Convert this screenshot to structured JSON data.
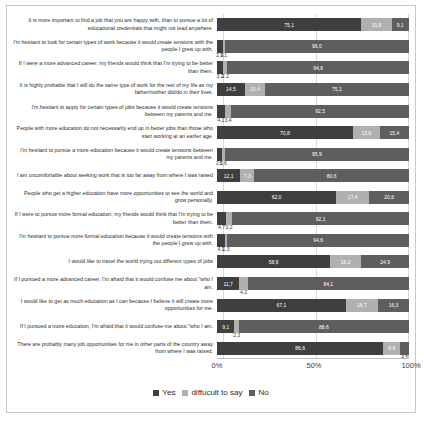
{
  "chart_data": {
    "type": "bar",
    "orientation": "horizontal",
    "stacked": true,
    "stacked_percent": true,
    "title": "",
    "xlabel": "",
    "ylabel": "",
    "xlim": [
      0,
      100
    ],
    "xticks": [
      "0%",
      "50%",
      "100%"
    ],
    "xtick_values": [
      0,
      50,
      100
    ],
    "grid": true,
    "legend_position": "bottom",
    "legend": [
      "Yes",
      "diffucult to say",
      "No"
    ],
    "series": [
      {
        "name": "Yes",
        "color": "#3f3f3f"
      },
      {
        "name": "diffucult to say",
        "color": "#b0b0b0"
      },
      {
        "name": "No",
        "color": "#5e5e5e"
      }
    ],
    "categories": [
      "It is more important to find a job that you are happy with, than to pursue a lot of educational credentials that might not lead anywhere.",
      "I'm hesitant to look for certain types of work because it would create tensions with the people I grew up with.",
      "If I were a more advanced career, my friends would think that I'm trying to be better than them.",
      "It is highly probable that I will do the same type of work for the rest of my life as my father/mother did/do in their lives.",
      "I'm hesitant to apply for certain types of jobs because it would create tensions between my parents and me.",
      "People with more education do not necessarily end up in better jobs than those who start working at an earlier age.",
      "I'm hesitant to pursue a more education because it would create tensions between my parents and me.",
      "I am uncomfortable about seeking work that is too far away from where I was raised",
      "People who get a higher education have more opportunities to see the world and grow personally.",
      "If I were to pursue more formal education, my friends would think that I'm trying to be better than them.",
      "I'm hesitant to pursue more formal education because it would create tensions with the people I grew up with.",
      "I would like to travel the world trying out different types of jobs",
      "If I pursued a more advanced career, I'm afraid that it would confuse me about \"who I am.",
      "I would like to get as much education as I can because I believe it will create more opportunities for me.",
      "If I pursued a more education, I'm afraid that it would confuse me about \"who I am.",
      "There are probably many job opportunities for me in other parts of the country away from where I was raised."
    ],
    "rows": [
      {
        "label": "It is more important to find a job that you are happy with, than to pursue a lot of educational credentials that might not lead anywhere.",
        "yes": 75.1,
        "difficult": 15.8,
        "no": 9.1,
        "yes_text": "75,1",
        "difficult_text": "15,8",
        "no_text": "9,1"
      },
      {
        "label": "I'm hesitant to look for certain types of work because it would create tensions with the people I grew up with.",
        "yes": 2.9,
        "difficult": 1.1,
        "no": 96.0,
        "yes_text": "2,9",
        "difficult_text": "1,1",
        "no_text": "96,0"
      },
      {
        "label": "If I were a more advanced career, my friends would think that I'm trying to be better than them.",
        "yes": 3.2,
        "difficult": 2.2,
        "no": 94.6,
        "yes_text": "3,2",
        "difficult_text": "2,2",
        "no_text": "94,6"
      },
      {
        "label": "It is highly probable that I will do the same type of work for the rest of my life as my father/mother did/do in their lives.",
        "yes": 14.5,
        "difficult": 10.4,
        "no": 75.1,
        "yes_text": "14,5",
        "difficult_text": "10,4",
        "no_text": "75,1"
      },
      {
        "label": "I'm hesitant to apply for certain types of jobs because it would create tensions between my parents and me.",
        "yes": 4.1,
        "difficult": 3.4,
        "no": 92.5,
        "yes_text": "4,1",
        "difficult_text": "3,4",
        "no_text": "92,5"
      },
      {
        "label": "People with more education do not necessarily end up in better jobs than those who start working at an earlier age.",
        "yes": 70.8,
        "difficult": 13.9,
        "no": 15.4,
        "yes_text": "70,8",
        "difficult_text": "13,9",
        "no_text": "15,4"
      },
      {
        "label": "I'm hesitant to pursue a more education because it would create tensions between my parents and me.",
        "yes": 2.5,
        "difficult": 1.6,
        "no": 95.9,
        "yes_text": "2,5",
        "difficult_text": "1,6",
        "no_text": "95,9"
      },
      {
        "label": "I am uncomfortable about seeking work that is too far away from where I was raised",
        "yes": 12.1,
        "difficult": 7.3,
        "no": 80.6,
        "yes_text": "12,1",
        "difficult_text": "7,3",
        "no_text": "80,6"
      },
      {
        "label": "People who get a higher education have more opportunities to see the world and grow personally.",
        "yes": 62.0,
        "difficult": 17.4,
        "no": 20.6,
        "yes_text": "62,0",
        "difficult_text": "17,4",
        "no_text": "20,6"
      },
      {
        "label": "If I were to pursue more formal education, my friends would think that I'm trying to be better than them.",
        "yes": 4.7,
        "difficult": 3.2,
        "no": 92.1,
        "yes_text": "4,7",
        "difficult_text": "3,2",
        "no_text": "92,1"
      },
      {
        "label": "I'm hesitant to pursue more formal education because it would create tensions with the people I grew up with.",
        "yes": 4.1,
        "difficult": 1.3,
        "no": 94.6,
        "yes_text": "4,1",
        "difficult_text": "1,3",
        "no_text": "94,6"
      },
      {
        "label": "I would like to travel the world trying out different types of jobs",
        "yes": 58.9,
        "difficult": 16.2,
        "no": 24.9,
        "yes_text": "58,9",
        "difficult_text": "16,2",
        "no_text": "24,9"
      },
      {
        "label": "If I pursued a more advanced career, I'm afraid that it would confuse me about \"who I am.",
        "yes": 11.7,
        "difficult": 4.2,
        "no": 84.1,
        "yes_text": "11,7",
        "difficult_text": "4,2",
        "no_text": "84,1"
      },
      {
        "label": "I would like to get as much education as I can because I believe it will create more opportunities for me.",
        "yes": 67.1,
        "difficult": 16.7,
        "no": 16.3,
        "yes_text": "67,1",
        "difficult_text": "16,7",
        "no_text": "16,3"
      },
      {
        "label": "If I pursued a more education, I'm afraid that it would confuse me about \"who I am.",
        "yes": 9.1,
        "difficult": 2.3,
        "no": 88.6,
        "yes_text": "9,1",
        "difficult_text": "2,3",
        "no_text": "88,6"
      },
      {
        "label": "There are probably many job opportunities for me in other parts of the country away from where I was raised.",
        "yes": 86.6,
        "difficult": 8.9,
        "no": 4.5,
        "yes_text": "86,6",
        "difficult_text": "8,9",
        "no_text": "4,5"
      }
    ]
  }
}
